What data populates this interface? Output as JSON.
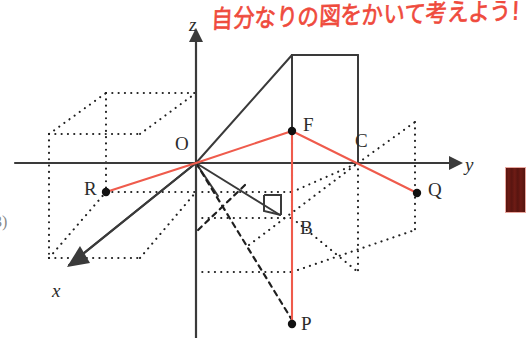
{
  "page": {
    "width": 526,
    "height": 338,
    "background": "#ffffff"
  },
  "annotation": {
    "handwritten_text": "自分なりの図をかいて考えよう!",
    "color": "#ef4a3c",
    "language": "ja"
  },
  "margin": {
    "problem_number": "3)"
  },
  "axes": {
    "color": "#3a3a3a",
    "origin_label": "O",
    "items": [
      {
        "name": "x",
        "label": "x",
        "label_x": 52,
        "label_y": 281
      },
      {
        "name": "y",
        "label": "y",
        "label_x": 465,
        "label_y": 155
      },
      {
        "name": "z",
        "label": "z",
        "label_x": 189,
        "label_y": 15
      }
    ]
  },
  "points": [
    {
      "id": "O",
      "label": "O",
      "x": 196,
      "y": 163,
      "label_x": 175,
      "label_y": 134,
      "dot": false,
      "color": "#1a1a1a"
    },
    {
      "id": "R",
      "label": "R",
      "x": 106,
      "y": 192,
      "label_x": 84,
      "label_y": 179,
      "dot": true,
      "color": "#1a1a1a"
    },
    {
      "id": "F",
      "label": "F",
      "x": 292,
      "y": 131,
      "label_x": 303,
      "label_y": 115,
      "dot": true,
      "color": "#1a1a1a"
    },
    {
      "id": "C",
      "label": "C",
      "x": 358,
      "y": 163,
      "label_x": 355,
      "label_y": 131,
      "dot": false,
      "color": "#1a1a1a"
    },
    {
      "id": "Q",
      "label": "Q",
      "x": 417,
      "y": 193,
      "label_x": 428,
      "label_y": 180,
      "dot": true,
      "color": "#1a1a1a"
    },
    {
      "id": "B",
      "label": "B",
      "x": 292,
      "y": 218,
      "label_x": 300,
      "label_y": 218,
      "dot": false,
      "color": "#1a1a1a"
    },
    {
      "id": "P",
      "label": "P",
      "x": 292,
      "y": 324,
      "label_x": 301,
      "label_y": 314,
      "dot": true,
      "color": "#1a1a1a"
    }
  ],
  "red_segments": {
    "color": "#ef5b4c",
    "list": [
      {
        "name": "R-O",
        "from": "R",
        "to": "O"
      },
      {
        "name": "O-F",
        "from": "O",
        "to": "F"
      },
      {
        "name": "F-Q",
        "from": "F",
        "to": "Q"
      },
      {
        "name": "F-B-P",
        "from": "F",
        "to": "P"
      }
    ]
  },
  "colors": {
    "ink": "#3a3a3a",
    "red_pen": "#ef4a3c",
    "red_line": "#ef5b4c",
    "dark_red_block": "#6d1a14",
    "paper": "#ffffff"
  },
  "artifacts": {
    "red_block_label": "scan-edge-artifact"
  }
}
